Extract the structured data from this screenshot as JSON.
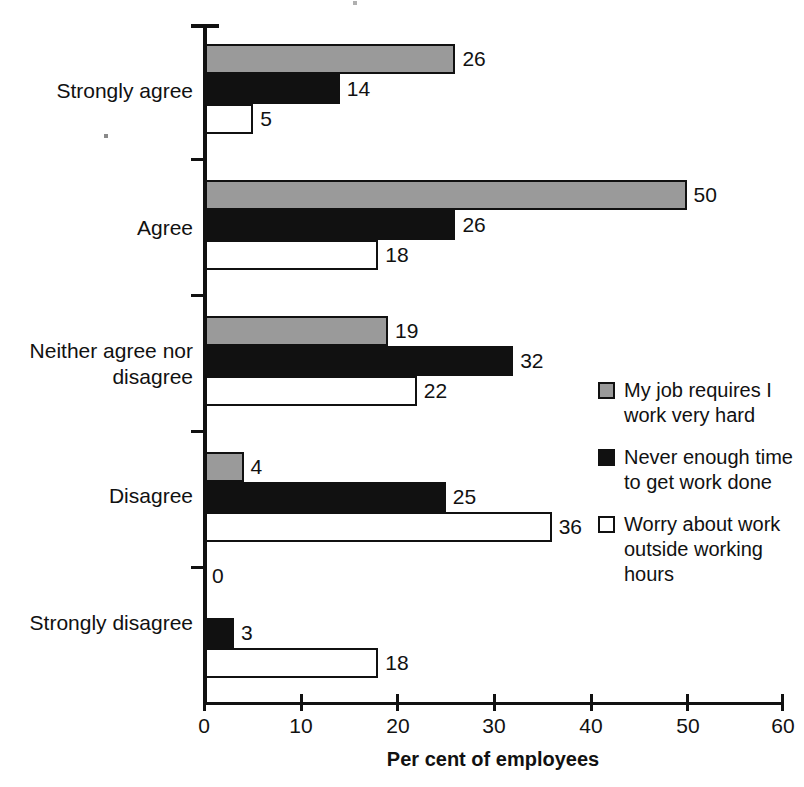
{
  "chart_data": {
    "type": "bar",
    "orientation": "horizontal",
    "title": "",
    "xlabel": "Per cent of employees",
    "ylabel": "",
    "xlim": [
      0,
      60
    ],
    "xticks": [
      0,
      10,
      20,
      30,
      40,
      50,
      60
    ],
    "xtick_labels": [
      "0",
      "10",
      "20",
      "30",
      "40",
      "50",
      "60"
    ],
    "grid": false,
    "legend_position": "right",
    "categories": [
      "Strongly agree",
      "Agree",
      "Neither agree nor\ndisagree",
      "Disagree",
      "Strongly disagree"
    ],
    "series": [
      {
        "name": "My job requires I work very hard",
        "color": "#9a9a9a",
        "values": [
          26,
          50,
          19,
          4,
          0
        ]
      },
      {
        "name": "Never enough time to get work done",
        "color": "#111111",
        "values": [
          14,
          26,
          32,
          25,
          3
        ]
      },
      {
        "name": "Worry about work outside working hours",
        "color": "#ffffff",
        "values": [
          5,
          18,
          22,
          36,
          18
        ]
      }
    ],
    "value_labels": [
      [
        "26",
        "14",
        "5"
      ],
      [
        "50",
        "26",
        "18"
      ],
      [
        "19",
        "32",
        "22"
      ],
      [
        "4",
        "25",
        "36"
      ],
      [
        "0",
        "3",
        "18"
      ]
    ]
  },
  "legend": {
    "items": [
      {
        "label": "My job requires I work very hard",
        "swatch": "gray-swatch"
      },
      {
        "label": "Never enough time to get work done",
        "swatch": "black-swatch"
      },
      {
        "label": "Worry about work outside working hours",
        "swatch": "white-swatch"
      }
    ]
  },
  "axis": {
    "x_title": "Per cent of employees",
    "x_tick_labels": [
      "0",
      "10",
      "20",
      "30",
      "40",
      "50",
      "60"
    ]
  }
}
